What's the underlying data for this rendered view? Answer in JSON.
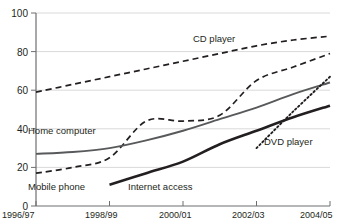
{
  "chart_data": {
    "type": "line",
    "title": "",
    "subtitle": "",
    "xlabel": "",
    "ylabel": "",
    "ylim": [
      0,
      100
    ],
    "yticks": [
      0,
      20,
      40,
      60,
      80,
      100
    ],
    "ytick_labels": [
      "0",
      "20",
      "40",
      "60",
      "80",
      "100"
    ],
    "grid": true,
    "legend_position": "inline-labels",
    "categories": [
      "1996/97",
      "1997/98",
      "1998/99",
      "1999/00",
      "2000/01",
      "2001/02",
      "2002/03",
      "2003/04",
      "2004/05"
    ],
    "xtick_labels": [
      "1996/97",
      "1998/99",
      "2000/01",
      "2002/03",
      "2004/05"
    ],
    "xtick_categories": [
      "1996/97",
      "1998/99",
      "2000/01",
      "2002/03",
      "2004/05"
    ],
    "series": [
      {
        "name": "CD player",
        "style": "dashed",
        "color": "#231f20",
        "values": [
          59,
          63,
          67,
          71,
          75,
          79,
          83,
          86,
          88
        ]
      },
      {
        "name": "Mobile phone",
        "style": "dashed",
        "color": "#231f20",
        "values": [
          17,
          20,
          25,
          44,
          44,
          47,
          65,
          72,
          79
        ]
      },
      {
        "name": "Home computer",
        "style": "solid-thin",
        "color": "#58595b",
        "values": [
          27,
          28,
          30,
          34,
          39,
          45,
          51,
          58,
          64
        ]
      },
      {
        "name": "Internet access",
        "style": "solid-thick",
        "color": "#231f20",
        "values": [
          null,
          null,
          11,
          17,
          23,
          32,
          39,
          46,
          52
        ]
      },
      {
        "name": "DVD player",
        "style": "dotted",
        "color": "#231f20",
        "values": [
          null,
          null,
          null,
          null,
          null,
          null,
          30,
          49,
          67
        ]
      }
    ],
    "series_labels": [
      {
        "name": "CD player",
        "text": "CD player"
      },
      {
        "name": "Home computer",
        "text": "Home computer"
      },
      {
        "name": "Mobile phone",
        "text": "Mobile phone"
      },
      {
        "name": "Internet access",
        "text": "Internet access"
      },
      {
        "name": "DVD player",
        "text": "DVD player"
      }
    ]
  }
}
